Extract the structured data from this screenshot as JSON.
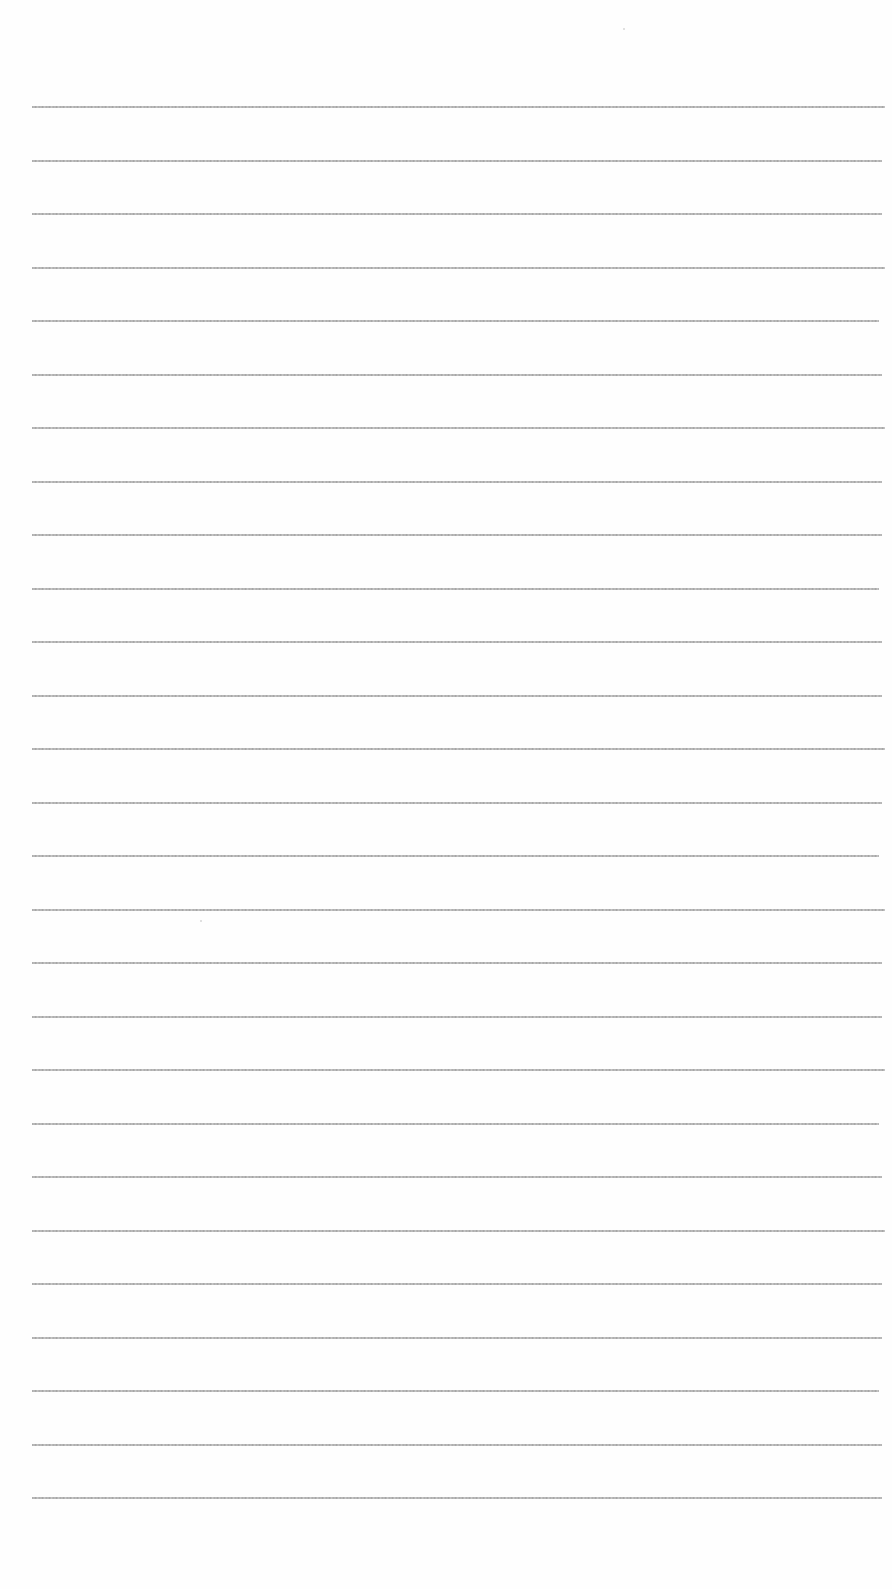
{
  "page": {
    "type": "lined-paper",
    "background": "#fefefe",
    "rule_color": "#a0a0a0",
    "rule_count": 27,
    "first_rule_y": 106,
    "rule_spacing": 53.5,
    "rule_left": 32,
    "rule_right": 885,
    "text": ""
  }
}
